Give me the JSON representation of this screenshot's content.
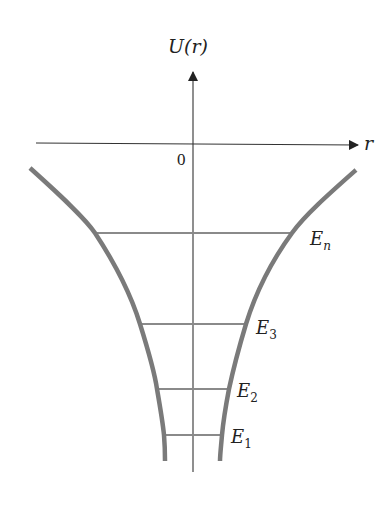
{
  "diagram": {
    "y_axis_label": "U(r)",
    "x_axis_label": "r",
    "origin_label": "0",
    "energy_levels": [
      {
        "label": "E",
        "subscript": "n",
        "y": 233,
        "x1": 95,
        "x2": 292
      },
      {
        "label": "E",
        "subscript": "3",
        "y": 324,
        "x1": 140,
        "x2": 246
      },
      {
        "label": "E",
        "subscript": "2",
        "y": 389,
        "x1": 157,
        "x2": 229
      },
      {
        "label": "E",
        "subscript": "1",
        "y": 435,
        "x1": 164,
        "x2": 222
      }
    ],
    "colors": {
      "curve": "#7a7a7a",
      "level_line": "#8a8a8a",
      "axis": "#333333",
      "text": "#222222"
    }
  }
}
